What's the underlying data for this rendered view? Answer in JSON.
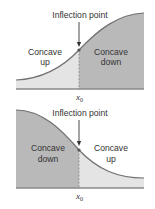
{
  "colors": {
    "light_fill": "#e4e4e4",
    "dark_fill": "#b9b9b9",
    "curve": "#707070",
    "axis": "#8a8a8a",
    "text": "#333333"
  },
  "diagrams": [
    {
      "id": "increasing",
      "annotation": "Inflection point",
      "left_region": {
        "line1": "Concave",
        "line2": "up"
      },
      "right_region": {
        "line1": "Concave",
        "line2": "down"
      },
      "x_label": "x",
      "x_label_sub": "0"
    },
    {
      "id": "decreasing",
      "annotation": "Inflection point",
      "left_region": {
        "line1": "Concave",
        "line2": "down"
      },
      "right_region": {
        "line1": "Concave",
        "line2": "up"
      },
      "x_label": "x",
      "x_label_sub": "0"
    }
  ]
}
